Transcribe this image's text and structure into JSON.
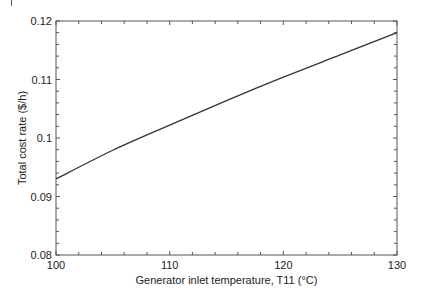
{
  "chart_data": {
    "type": "line",
    "title": "",
    "xlabel": "Generator inlet temperature, T11 (°C)",
    "ylabel": "Total cost rate ($/h)",
    "xlim": [
      100,
      130
    ],
    "ylim": [
      0.08,
      0.12
    ],
    "x_ticks": [
      100,
      110,
      120,
      130
    ],
    "x_tick_labels": [
      "100",
      "110",
      "120",
      "130"
    ],
    "y_ticks": [
      0.08,
      0.09,
      0.1,
      0.11,
      0.12
    ],
    "y_tick_labels": [
      "0.08",
      "0.09",
      "0.1",
      "0.11",
      "0.12"
    ],
    "x_minor_step": 2,
    "y_minor_step": 0.002,
    "grid": false,
    "legend": null,
    "series": [
      {
        "name": "Total cost rate",
        "color": "#333333",
        "x": [
          100,
          105,
          110,
          115,
          120,
          125,
          130
        ],
        "y": [
          0.093,
          0.0979,
          0.1022,
          0.1064,
          0.1104,
          0.1142,
          0.118
        ]
      }
    ]
  },
  "layout": {
    "plot_left": 56,
    "plot_right": 397,
    "plot_top": 21,
    "plot_bottom": 255,
    "axis_color": "#555555"
  }
}
